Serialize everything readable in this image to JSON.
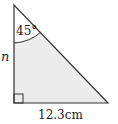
{
  "diagram": {
    "type": "right-triangle",
    "angle_label": "45°",
    "side_label_vertical": "n",
    "side_label_base": "12.3cm",
    "colors": {
      "stroke": "#333333",
      "fill": "#ebebeb",
      "text": "#222222"
    }
  }
}
